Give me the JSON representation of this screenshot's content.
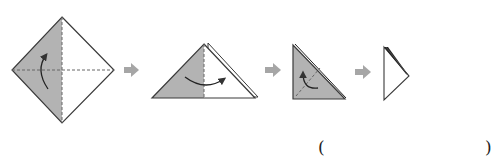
{
  "diagram": {
    "type": "origami-folding-steps",
    "colors": {
      "paper_colored": "#b3b3b3",
      "paper_white": "#ffffff",
      "outline": "#3a3a3a",
      "fold_line": "#666666",
      "step_arrow": "#a6a6a6",
      "motion_arrow": "#333333"
    },
    "steps": [
      {
        "index": 1,
        "shape": "square-diamond",
        "description": "Diamond with left half colored, dashed vertical and horizontal fold lines, curved arrow folding bottom up"
      },
      {
        "index": 2,
        "shape": "triangle",
        "description": "Folded triangle, left half colored, curved arrow folding left to right"
      },
      {
        "index": 3,
        "shape": "right-triangle",
        "description": "Colored right triangle with dashed diagonal fold line and curved arrow"
      },
      {
        "index": 4,
        "shape": "narrow-triangle",
        "description": "Final narrow white triangle with layered dark edge"
      }
    ],
    "step_arrows": 3
  },
  "answer": {
    "open_paren": "(",
    "close_paren": ")",
    "blank": ""
  }
}
